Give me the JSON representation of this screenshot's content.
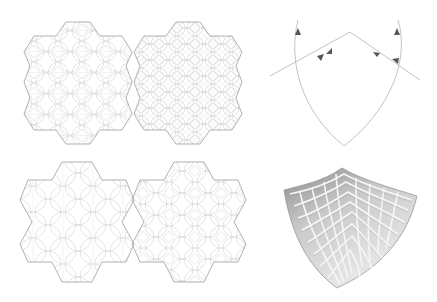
{
  "figure": {
    "background": "#ffffff",
    "stroke_color": "#b8b8b8",
    "inner_stroke_color": "#d2d2d2",
    "arrow_color": "#555555",
    "panels": [
      {
        "id": "tiling-top-left",
        "shape": "hexagonal-star-outline",
        "pattern": "circle-packing-fine"
      },
      {
        "id": "tiling-top-right",
        "shape": "hexagonal-star-outline",
        "pattern": "circle-packing-dense"
      },
      {
        "id": "tiling-bottom-left",
        "shape": "six-point-star-outline",
        "pattern": "circle-packing-coarse"
      },
      {
        "id": "tiling-bottom-right",
        "shape": "six-point-star-outline",
        "pattern": "circle-packing-quad"
      },
      {
        "id": "arrow-diagram",
        "shape": "pointed-arch-with-reflection-arrows",
        "arrow_count": 6
      },
      {
        "id": "gridshell-render",
        "shape": "curved-quad-grid-3d",
        "grid_divisions": [
          8,
          8
        ]
      }
    ]
  }
}
